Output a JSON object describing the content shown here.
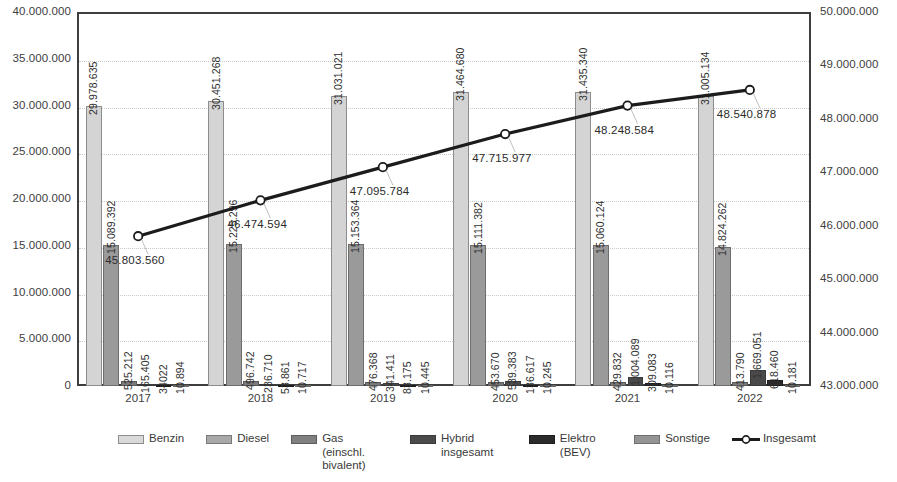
{
  "chart_data": {
    "type": "bar",
    "title": "",
    "subtitle": "",
    "xlabel": "",
    "ylabel": "",
    "categories": [
      "2017",
      "2018",
      "2019",
      "2020",
      "2021",
      "2022"
    ],
    "grid": true,
    "legend_position": "bottom",
    "left_axis": {
      "label": "",
      "min": 0,
      "max": 40000000,
      "step": 5000000,
      "ticks": [
        "0",
        "5.000.000",
        "10.000.000",
        "15.000.000",
        "20.000.000",
        "25.000.000",
        "30.000.000",
        "35.000.000",
        "40.000.000"
      ]
    },
    "right_axis": {
      "label": "",
      "min": 43000000,
      "max": 50000000,
      "step": 1000000,
      "ticks": [
        "43.000.000",
        "44.000.000",
        "45.000.000",
        "46.000.000",
        "47.000.000",
        "48.000.000",
        "49.000.000",
        "50.000.000"
      ]
    },
    "series": [
      {
        "name": "Benzin",
        "axis": "left",
        "values": [
          29978635,
          30451268,
          31031021,
          31464680,
          31435340,
          31005134
        ],
        "labels": [
          "29.978.635",
          "30.451.268",
          "31.031.021",
          "31.464.680",
          "31.435.340",
          "31.005.134"
        ]
      },
      {
        "name": "Diesel",
        "axis": "left",
        "values": [
          15089392,
          15225296,
          15153364,
          15111382,
          15060124,
          14824262
        ],
        "labels": [
          "15.089.392",
          "15.225.296",
          "15.153.364",
          "15.111.382",
          "15.060.124",
          "14.824.262"
        ]
      },
      {
        "name": "Gas (einschl. bivalent)",
        "axis": "left",
        "values": [
          525212,
          496742,
          476368,
          453670,
          429832,
          413790
        ],
        "labels": [
          "525.212",
          "496.742",
          "476.368",
          "453.670",
          "429.832",
          "413.790"
        ]
      },
      {
        "name": "Hybrid insgesamt",
        "axis": "left",
        "values": [
          165405,
          236710,
          341411,
          539383,
          1004089,
          1669051
        ],
        "labels": [
          "165.405",
          "236.710",
          "341.411",
          "539.383",
          "1.004.089",
          "1.669.051"
        ]
      },
      {
        "name": "Elektro (BEV)",
        "axis": "left",
        "values": [
          34022,
          53861,
          83175,
          136617,
          309083,
          618460
        ],
        "labels": [
          "34022",
          "53.861",
          "83.175",
          "136.617",
          "309.083",
          "618.460"
        ]
      },
      {
        "name": "Sonstige",
        "axis": "left",
        "values": [
          10894,
          10717,
          10445,
          10245,
          10116,
          10181
        ],
        "labels": [
          "10.894",
          "10.717",
          "10.445",
          "10.245",
          "10.116",
          "10.181"
        ]
      },
      {
        "name": "Insgesamt",
        "axis": "right",
        "type": "line",
        "values": [
          45803560,
          46474594,
          47095784,
          47715977,
          48248584,
          48540878
        ],
        "labels": [
          "45.803.560",
          "46.474.594",
          "47.095.784",
          "47.715.977",
          "48.248.584",
          "48.540.878"
        ]
      }
    ]
  },
  "legend": {
    "items": [
      {
        "label": "Benzin",
        "key": "benzin"
      },
      {
        "label": "Diesel",
        "key": "diesel"
      },
      {
        "label": "Gas (einschl. bivalent)",
        "key": "gas"
      },
      {
        "label": "Hybrid insgesamt",
        "key": "hybrid"
      },
      {
        "label": "Elektro (BEV)",
        "key": "elektro"
      },
      {
        "label": "Sonstige",
        "key": "sonstige"
      },
      {
        "label": "Insgesamt",
        "key": "insgesamt"
      }
    ]
  }
}
